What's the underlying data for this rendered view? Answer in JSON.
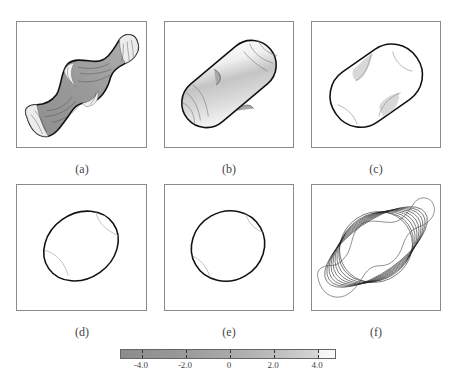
{
  "figure": {
    "panels": [
      {
        "id": "a",
        "caption": "(a)"
      },
      {
        "id": "b",
        "caption": "(b)"
      },
      {
        "id": "c",
        "caption": "(c)"
      },
      {
        "id": "d",
        "caption": "(d)"
      },
      {
        "id": "e",
        "caption": "(e)"
      },
      {
        "id": "f",
        "caption": "(f)"
      }
    ],
    "colorbar": {
      "ticks": [
        "-4.0",
        "-2.0",
        "0",
        "2.0",
        "4.0"
      ],
      "colormap": "grayscale",
      "low_color": "#8c8c8c",
      "high_color": "#fafafa"
    }
  }
}
